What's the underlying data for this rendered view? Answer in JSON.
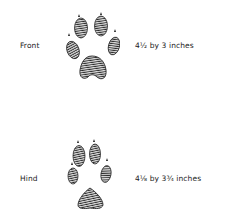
{
  "tracks": [
    {
      "name": "Front",
      "size": "4½ by 3 inches",
      "icon": "paw-print-front-icon"
    },
    {
      "name": "Hind",
      "size": "4⅛ by 3¾ inches",
      "icon": "paw-print-hind-icon"
    }
  ],
  "colors": {
    "ink": "#2a2a2a",
    "background": "#ffffff"
  }
}
